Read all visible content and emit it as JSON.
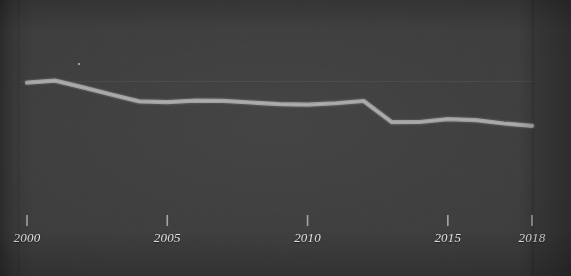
{
  "meta": {
    "background_color": "#3a3a3a",
    "line_color": "#9a9a9a",
    "axis_color": "#a8a8a8",
    "grid_color": "#4a4a4a",
    "text_color": "#e6e6e6"
  },
  "chart_data": {
    "type": "line",
    "title": "",
    "subtitle": "",
    "xlabel": "",
    "ylabel": "",
    "grid": true,
    "legend": false,
    "legend_position": "none",
    "xlim": [
      2000,
      2018
    ],
    "ylim": [
      0,
      100
    ],
    "tick_labels": [
      "2000",
      "2005",
      "2010",
      "2015",
      "2018"
    ],
    "tick_values": [
      2000,
      2005,
      2010,
      2015,
      2018
    ],
    "gridlines_y": [
      72
    ],
    "series": [
      {
        "name": "series-1",
        "x": [
          2000,
          2001,
          2002,
          2003,
          2004,
          2005,
          2006,
          2007,
          2008,
          2009,
          2010,
          2011,
          2012,
          2013,
          2014,
          2015,
          2016,
          2017,
          2018
        ],
        "values": [
          71.4,
          72.5,
          68.8,
          64.9,
          61.2,
          60.8,
          61.6,
          61.5,
          60.6,
          59.7,
          59.4,
          60.2,
          61.4,
          49.9,
          50.0,
          51.6,
          51.0,
          49.2,
          47.9
        ]
      }
    ]
  },
  "axis": {
    "x_axis_name": "x-axis",
    "x_axis_start_px": 20,
    "x_axis_end_px": 534
  }
}
